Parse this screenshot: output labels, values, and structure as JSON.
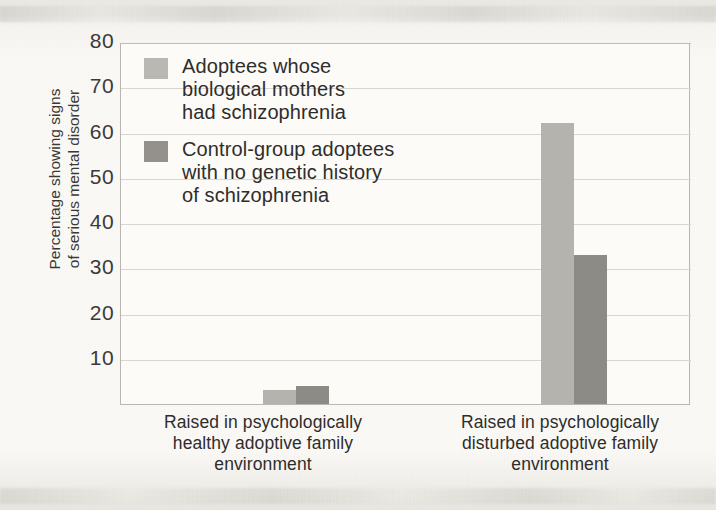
{
  "figure": {
    "background_color": "#f4f3ef",
    "plot_background_color": "#fcfbf8",
    "grid_color": "#d8d6d1"
  },
  "axis": {
    "y_label": "Percentage showing signs\nof serious mental disorder",
    "y_ticks": [
      "80",
      "70",
      "60",
      "50",
      "40",
      "30",
      "20",
      "10"
    ]
  },
  "legend": {
    "items": [
      {
        "label": "Adoptees whose\nbiological mothers\nhad schizophrenia",
        "color": "#bab8b3",
        "swatch_name": "legend-swatch-adoptees-schizophrenia"
      },
      {
        "label": "Control-group adoptees\nwith no genetic history\nof schizophrenia",
        "color": "#94918c",
        "swatch_name": "legend-swatch-control-group"
      }
    ]
  },
  "chart_data": {
    "type": "bar",
    "title": "",
    "xlabel": "",
    "ylabel": "Percentage showing signs of serious mental disorder",
    "ylim": [
      0,
      80
    ],
    "yticks": [
      10,
      20,
      30,
      40,
      50,
      60,
      70,
      80
    ],
    "grid": true,
    "legend_position": "upper-left-inside",
    "categories": [
      "Raised in psychologically\nhealthy adoptive family\nenvironment",
      "Raised in psychologically\ndisturbed adoptive family\nenvironment"
    ],
    "series": [
      {
        "name": "Adoptees whose biological mothers had schizophrenia",
        "color": "#b5b3ae",
        "values": [
          3,
          62
        ]
      },
      {
        "name": "Control-group adoptees with no genetic history of schizophrenia",
        "color": "#8d8b86",
        "values": [
          4,
          33
        ]
      }
    ]
  }
}
